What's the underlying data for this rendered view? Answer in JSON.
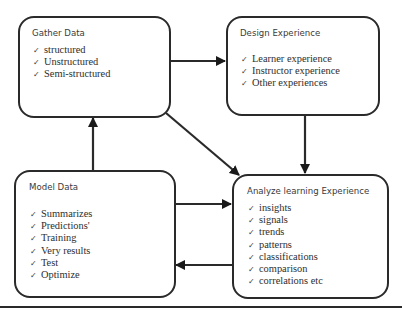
{
  "diagram": {
    "nodes": [
      {
        "id": "gather",
        "title": "Gather Data",
        "items": [
          "structured",
          "Unstructured",
          "Semi-structured"
        ]
      },
      {
        "id": "design",
        "title": "Design Experience",
        "items": [
          "Learner experience",
          "Instructor experience",
          "Other experiences"
        ]
      },
      {
        "id": "model",
        "title": "Model Data",
        "items": [
          "Summarizes",
          "Predictions'",
          "Training",
          "Very results",
          "Test",
          "Optimize"
        ]
      },
      {
        "id": "analyze",
        "title": "Analyze learning Experience",
        "items": [
          "insights",
          "signals",
          "trends",
          "patterns",
          "classifications",
          "comparison",
          "correlations etc"
        ]
      }
    ],
    "edges": [
      {
        "from": "gather",
        "to": "design"
      },
      {
        "from": "gather",
        "to": "analyze"
      },
      {
        "from": "design",
        "to": "analyze"
      },
      {
        "from": "model",
        "to": "gather"
      },
      {
        "from": "model",
        "to": "analyze"
      },
      {
        "from": "analyze",
        "to": "model"
      }
    ],
    "check_glyph": "✓",
    "colors": {
      "stroke": "#2a2a2a",
      "text": "#2e2e2e",
      "background": "#ffffff"
    }
  }
}
